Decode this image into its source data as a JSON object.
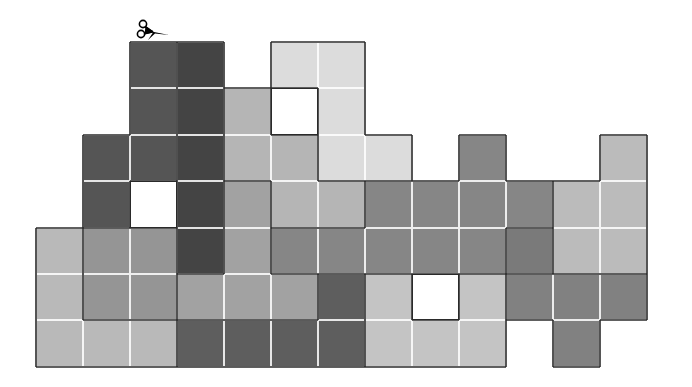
{
  "puzzle": {
    "type": "grid-cut-puzzle",
    "grid": {
      "origin_x": 36,
      "origin_y": 42,
      "cell_w": 47,
      "cell_h": 46.4,
      "cols": 13,
      "rows": 7
    },
    "palette": {
      "A": "#555555",
      "B": "#444444",
      "C": "#dcdcdc",
      "D": "#b5b5b5",
      "E": "#a2a2a2",
      "F": "#868686",
      "G": "#bbbbbb",
      "H": "#b9b9b9",
      "I": "#959595",
      "J": "#7a7a7a",
      "K": "#5e5e5e",
      "L": "#c4c4c4",
      "M": "#818181",
      "W": "hole"
    },
    "rows": [
      "..AB.CC......",
      "..ABDWC......",
      ".AABDDCC.F..G",
      ".AWBEDDFFFFGG",
      "HIIBEFFFFFJGG",
      "HIIEEEKLWLMMM",
      "HHHKKKKLLL.M."
    ],
    "regions": [
      {
        "name": "dark-column-left",
        "color": "A"
      },
      {
        "name": "darkest-column",
        "color": "B"
      },
      {
        "name": "light-top-block",
        "color": "C"
      },
      {
        "name": "mid-gray-block",
        "color": "D"
      },
      {
        "name": "gray-band",
        "color": "F"
      },
      {
        "name": "right-light-block",
        "color": "G"
      },
      {
        "name": "bottom-left-light",
        "color": "H"
      },
      {
        "name": "left-mid-block",
        "color": "I"
      },
      {
        "name": "bottom-dark-block",
        "color": "K"
      },
      {
        "name": "bottom-light-block",
        "color": "L"
      },
      {
        "name": "bottom-right-block",
        "color": "M"
      }
    ],
    "tool": {
      "icon": "scissors-icon",
      "position": "above column 2 row 0"
    }
  }
}
